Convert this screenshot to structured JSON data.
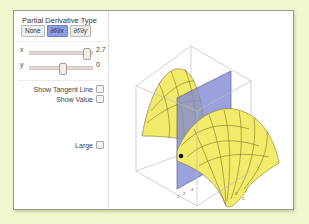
{
  "controls": {
    "title": "Partial Derivative Type",
    "derivative_type": {
      "options": [
        {
          "label": "None",
          "active": false,
          "italic": false
        },
        {
          "label": "∂f/∂x",
          "active": true,
          "italic": true
        },
        {
          "label": "∂f/∂y",
          "active": false,
          "italic": true
        }
      ]
    },
    "sliders": [
      {
        "label": "x",
        "value": "2.7",
        "thumb_pct": 90
      },
      {
        "label": "y",
        "value": "0",
        "thumb_pct": 50
      }
    ],
    "checkboxes": {
      "show_tangent_line": {
        "label": "Show Tangent Line",
        "checked": false
      },
      "show_value": {
        "label": "Show Value",
        "checked": false
      },
      "large": {
        "label": "Large",
        "checked": false
      }
    }
  },
  "plot": {
    "surface_color": "#f3ec6a",
    "plane_color": "#7f86d4",
    "box_color": "#b8b8b8",
    "axis_ticks": [
      "2",
      "2",
      "4",
      "0",
      "2"
    ]
  },
  "colors": {
    "background": "#f3f7cf",
    "active_button": "#8d9fe0"
  }
}
